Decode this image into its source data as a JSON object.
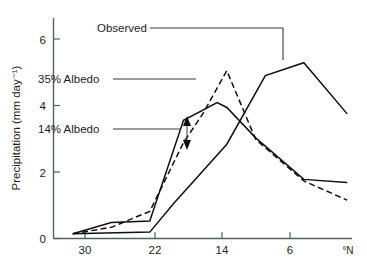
{
  "chart_data": {
    "type": "line",
    "title": "",
    "xlabel": "",
    "ylabel": "Precipitation (mm day⁻¹)",
    "x_unit_label": "°N",
    "xlim": [
      32,
      1
    ],
    "ylim": [
      0,
      6.9
    ],
    "x_ticks": [
      30,
      22,
      14,
      6
    ],
    "x_tick_labels": [
      "30",
      "22",
      "14",
      "6"
    ],
    "y_ticks": [
      0,
      2,
      4,
      6
    ],
    "y_tick_labels": [
      "0",
      "2",
      "4",
      "6"
    ],
    "grid": false,
    "legend_position": "inline-annotations",
    "x_axis_direction": "decreasing",
    "series": [
      {
        "name": "Observed",
        "style": "solid",
        "x": [
          30,
          22,
          19.5,
          14,
          10,
          6,
          1.5
        ],
        "values": [
          0.15,
          0.2,
          1.1,
          2.95,
          5.1,
          5.5,
          3.9
        ]
      },
      {
        "name": "35% Albedo",
        "style": "solid",
        "x": [
          30,
          26,
          22,
          18.5,
          15,
          14,
          11,
          6,
          1.5
        ],
        "values": [
          0.15,
          0.5,
          0.55,
          3.7,
          4.25,
          4.1,
          3.15,
          1.85,
          1.75
        ]
      },
      {
        "name": "14% Albedo",
        "style": "dashed",
        "x": [
          30,
          26,
          22,
          18.5,
          16.5,
          14,
          11,
          6,
          1.5
        ],
        "values": [
          0.15,
          0.35,
          0.85,
          3.0,
          3.9,
          5.25,
          3.1,
          1.8,
          1.2
        ]
      }
    ],
    "annotations": [
      {
        "label": "Observed",
        "label_x": 97,
        "label_y": 32,
        "leader": "M 150,28 L 283,28 L 283,60"
      },
      {
        "label": "35% Albedo",
        "label_x": 38,
        "label_y": 83,
        "leader": "M 113,79 L 196,79"
      },
      {
        "label": "14% Albedo",
        "label_x": 38,
        "label_y": 133,
        "leader": "M 113,129 L 181,129"
      }
    ],
    "range_arrow": {
      "x": 187,
      "y_top": 119,
      "y_bottom": 147,
      "double_headed": true
    }
  }
}
